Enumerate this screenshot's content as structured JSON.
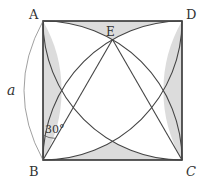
{
  "diagram": {
    "colors": {
      "stroke": "#444444",
      "shade": "#dcdcdc",
      "label": "#333333"
    },
    "square": {
      "side_label": "a",
      "vertices": {
        "A": {
          "label": "A",
          "x": 43,
          "y": 21
        },
        "B": {
          "label": "B",
          "x": 43,
          "y": 160
        },
        "C": {
          "label": "C",
          "x": 182,
          "y": 160
        },
        "D": {
          "label": "D",
          "x": 182,
          "y": 21
        }
      }
    },
    "points": {
      "E": {
        "label": "E",
        "x": 112.5,
        "y": 39.6
      }
    },
    "arcs": [
      {
        "center": "B",
        "from": "A",
        "to": "C"
      },
      {
        "center": "C",
        "from": "B",
        "to": "D"
      },
      {
        "center": "A",
        "from": "B",
        "to": "D"
      },
      {
        "center": "D",
        "from": "A",
        "to": "C"
      }
    ],
    "segments": [
      {
        "from": "B",
        "to": "E"
      },
      {
        "from": "C",
        "to": "E"
      }
    ],
    "angle": {
      "vertex": "B",
      "between": [
        "BA",
        "BE"
      ],
      "label": "30°"
    },
    "dimension": {
      "label": "a",
      "along": "AB"
    }
  }
}
